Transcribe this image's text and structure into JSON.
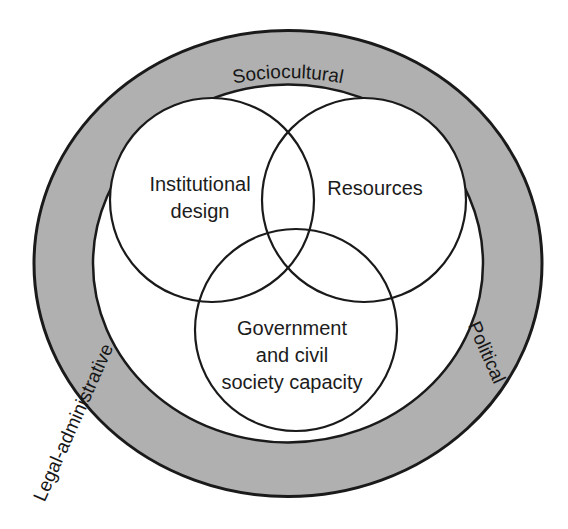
{
  "figure": {
    "type": "venn-in-ring-diagram",
    "background_color": "#ffffff",
    "ring": {
      "fill_color": "#b0b0b0",
      "stroke_color": "#1a1a1a",
      "labels": [
        {
          "id": "sociocultural",
          "text": "Sociocultural",
          "position": "top-arc"
        },
        {
          "id": "political",
          "text": "Political",
          "position": "right-arc"
        },
        {
          "id": "legal-administrative",
          "text": "Legal-administrative",
          "position": "left-arc"
        }
      ]
    },
    "venn": {
      "fill_color": "#ffffff",
      "stroke_color": "#1a1a1a",
      "sets": [
        {
          "id": "institutional-design",
          "label_lines": [
            "Institutional",
            "design"
          ],
          "position": "top-left"
        },
        {
          "id": "resources",
          "label_lines": [
            "Resources"
          ],
          "position": "top-right"
        },
        {
          "id": "government-civil-society-capacity",
          "label_lines": [
            "Government",
            "and civil",
            "society capacity"
          ],
          "position": "bottom"
        }
      ]
    }
  },
  "labels": {
    "sociocultural": "Sociocultural",
    "political": "Political",
    "legal_administrative": "Legal-administrative",
    "institutional_design_line1": "Institutional",
    "institutional_design_line2": "design",
    "resources": "Resources",
    "government_line1": "Government",
    "government_line2": "and civil",
    "government_line3": "society capacity"
  }
}
